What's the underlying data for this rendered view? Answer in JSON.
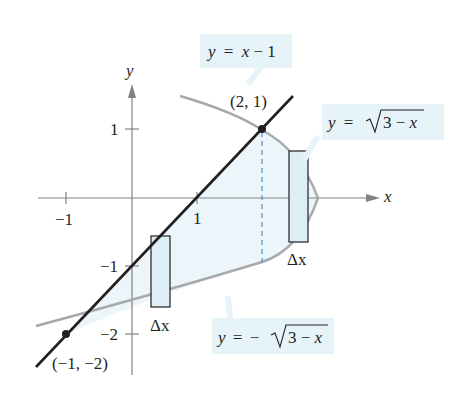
{
  "axes": {
    "x_label": "x",
    "y_label": "y",
    "x_ticks": [
      {
        "value": -1,
        "label": "−1"
      },
      {
        "value": 1,
        "label": "1"
      }
    ],
    "y_ticks": [
      {
        "value": 1,
        "label": "1"
      },
      {
        "value": -1,
        "label": "−1"
      },
      {
        "value": -2,
        "label": "−2"
      }
    ]
  },
  "curves": {
    "line": {
      "label": "y = x − 1",
      "lhs": "y",
      "eq": "=",
      "rhs": "x − 1",
      "color": "#231f20"
    },
    "upper": {
      "label": "y = √(3 − x)",
      "lhs": "y",
      "eq": "=",
      "rad": "3 − x",
      "color": "#a7a9ac"
    },
    "lower": {
      "label": "y = −√(3 − x)",
      "lhs": "y",
      "eq": "=",
      "neg": "−",
      "rad": "3 − x",
      "color": "#a7a9ac"
    }
  },
  "points": [
    {
      "label": "(2, 1)",
      "x": 2,
      "y": 1
    },
    {
      "label": "(−1, −2)",
      "x": -1,
      "y": -2
    }
  ],
  "rectangles": [
    {
      "label": "Δx",
      "between": "line and lower curve"
    },
    {
      "label": "Δx",
      "between": "upper and lower curve"
    }
  ],
  "colors": {
    "region_fill": "#e8f4f9",
    "rect_fill": "#ddeef6",
    "label_bg": "#e6f3f8",
    "dashed": "#4a90c8",
    "axis": "#808285"
  }
}
